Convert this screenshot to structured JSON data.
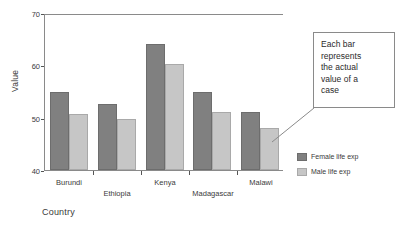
{
  "chart_data": {
    "type": "bar",
    "title": "",
    "subtitle": "",
    "xlabel": "Country",
    "ylabel": "Value",
    "categories": [
      "Burundi",
      "Ethiopia",
      "Kenya",
      "Madagascar",
      "Malawi"
    ],
    "series": [
      {
        "name": "Female life exp",
        "color": "#808080",
        "values": [
          55,
          52.6,
          64,
          55,
          51
        ]
      },
      {
        "name": "Male life exp",
        "color": "#c6c6c6",
        "values": [
          50.7,
          49.7,
          60.2,
          51,
          48
        ]
      }
    ],
    "ylim": [
      40,
      70
    ],
    "yticks": [
      40,
      50,
      60,
      70
    ],
    "ytick_labels": [
      "40",
      "50",
      "60",
      "70"
    ],
    "grid": false,
    "legend_position": "right",
    "annotations": [
      {
        "text": "Each bar represents the actual value of a case",
        "lines": [
          "Each bar",
          "represents",
          "the actual",
          "value of a",
          "case"
        ],
        "points_to": "Malawi male life exp bar"
      }
    ]
  },
  "legend": {
    "items": [
      {
        "label": "Female life exp"
      },
      {
        "label": "Male life exp"
      }
    ]
  },
  "callout": {
    "line1": "Each bar",
    "line2": "represents",
    "line3": "the actual",
    "line4": "value of a",
    "line5": "case"
  },
  "axes": {
    "y_title": "Value",
    "x_title": "Country",
    "y_labels": [
      "70",
      "60",
      "50",
      "40"
    ],
    "x_labels": [
      "Burundi",
      "Ethiopia",
      "Kenya",
      "Madagascar",
      "Malawi"
    ]
  }
}
